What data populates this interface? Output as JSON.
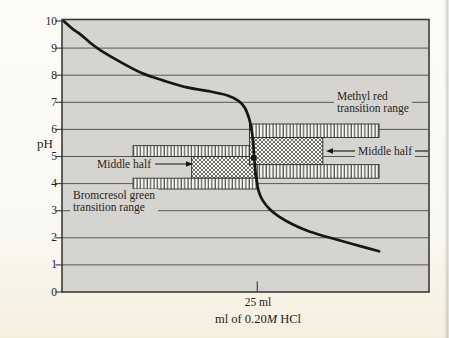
{
  "chart_data": {
    "type": "line",
    "title": "",
    "xlabel": "ml of 0.20M HCl",
    "ylabel": "pH",
    "xlim_ml": [
      0,
      47
    ],
    "ylim_pH": [
      0,
      10
    ],
    "grid": "horizontal",
    "y_ticks": [
      10,
      9,
      8,
      7,
      6,
      5,
      4,
      3,
      2,
      1,
      0
    ],
    "x_ticks": [
      {
        "ml": 25,
        "label": "25 ml"
      }
    ],
    "series": [
      {
        "name": "titration curve (pH vs ml HCl)",
        "points_ml_pH": [
          [
            0.2,
            10.0
          ],
          [
            1.3,
            9.72
          ],
          [
            2.4,
            9.5
          ],
          [
            3.6,
            9.2
          ],
          [
            5.3,
            8.85
          ],
          [
            7.4,
            8.5
          ],
          [
            10.2,
            8.08
          ],
          [
            13.0,
            7.8
          ],
          [
            16.0,
            7.55
          ],
          [
            19.0,
            7.4
          ],
          [
            21.2,
            7.25
          ],
          [
            22.6,
            7.05
          ],
          [
            23.4,
            6.8
          ],
          [
            23.9,
            6.45
          ],
          [
            24.2,
            6.1
          ],
          [
            24.45,
            5.6
          ],
          [
            24.6,
            5.0
          ],
          [
            24.75,
            4.5
          ],
          [
            24.95,
            4.05
          ],
          [
            25.2,
            3.7
          ],
          [
            25.7,
            3.38
          ],
          [
            26.5,
            3.08
          ],
          [
            27.7,
            2.8
          ],
          [
            29.5,
            2.5
          ],
          [
            31.5,
            2.25
          ],
          [
            34.1,
            2.02
          ],
          [
            37.2,
            1.77
          ],
          [
            40.6,
            1.5
          ]
        ]
      }
    ],
    "equivalence_point": {
      "ml": 24.55,
      "pH": 4.95
    },
    "indicator_bands": [
      {
        "name": "Bromcresol green",
        "transition_range_pH": [
          3.8,
          5.4
        ],
        "middle_half_pH": [
          4.2,
          5.0
        ],
        "segments": [
          {
            "part": "upper-quarter",
            "hatch": "vertical",
            "pH": [
              5.0,
              5.4
            ],
            "ml": [
              9.1,
              24.2
            ]
          },
          {
            "part": "middle-half",
            "hatch": "cross",
            "pH": [
              4.2,
              5.0
            ],
            "ml": [
              16.6,
              24.7
            ]
          },
          {
            "part": "lower-quarter",
            "hatch": "vertical",
            "pH": [
              3.8,
              4.2
            ],
            "ml": [
              9.1,
              25.0
            ]
          }
        ]
      },
      {
        "name": "Methyl red",
        "transition_range_pH": [
          4.2,
          6.2
        ],
        "middle_half_pH": [
          4.7,
          5.7
        ],
        "segments": [
          {
            "part": "upper-quarter",
            "hatch": "vertical",
            "pH": [
              5.7,
              6.2
            ],
            "ml": [
              24.0,
              40.6
            ]
          },
          {
            "part": "middle-half",
            "hatch": "cross",
            "pH": [
              4.7,
              5.7
            ],
            "ml": [
              24.0,
              33.4
            ]
          },
          {
            "part": "lower-quarter",
            "hatch": "vertical",
            "pH": [
              4.2,
              4.7
            ],
            "ml": [
              25.0,
              40.6
            ]
          }
        ]
      }
    ],
    "annotations": [
      {
        "id": "methyl-red-label",
        "text": "Methyl red transition range"
      },
      {
        "id": "bromcresol-green-label",
        "text": "Bromcresol green transition range"
      },
      {
        "id": "middle-half-left",
        "text": "Middle half",
        "arrow_px": {
          "x1": 155,
          "y1": 164,
          "x2": 193,
          "y2": 164
        }
      },
      {
        "id": "middle-half-right",
        "text": "Middle half",
        "arrow_px": {
          "x1": 356,
          "y1": 151,
          "x2": 326,
          "y2": 151
        },
        "tail_px": {
          "x1": 415,
          "y1": 151,
          "x2": 428,
          "y2": 151
        }
      }
    ]
  },
  "figure": {
    "xlabel": {
      "pre": "ml of 0.20",
      "italic": "M",
      "post": " HCl"
    }
  },
  "labels": {
    "methyl_red_lines": [
      "Methyl red",
      "transition range"
    ],
    "bromcresol_lines": [
      "Bromcresol green",
      "transition range"
    ],
    "middle_half_left": "Middle half",
    "middle_half_right": "Middle half"
  },
  "colors": {
    "plot_bg": "#d6d4d0",
    "grid": "#5a5751",
    "frame": "#3c3a36",
    "curve": "#171614",
    "band_bg": "#f8f7f3",
    "hatch": "#3a3733",
    "band_stroke": "#2f2d29",
    "text": "#262420"
  }
}
